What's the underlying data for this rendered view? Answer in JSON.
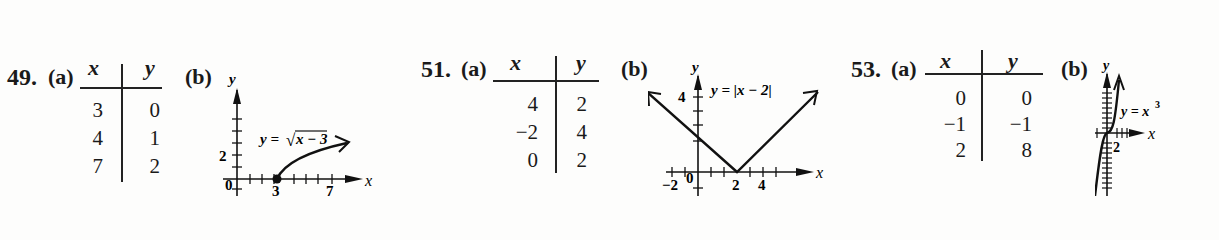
{
  "problems": [
    {
      "number": "49.",
      "part_a": "(a)",
      "part_b": "(b)",
      "table": {
        "headers": [
          "x",
          "y"
        ],
        "rows": [
          [
            "3",
            "0"
          ],
          [
            "4",
            "1"
          ],
          [
            "7",
            "2"
          ]
        ]
      },
      "graph": {
        "equation_prefix": "y = ",
        "equation_body": "x − 3",
        "axis_x": "x",
        "axis_y": "y",
        "tick_labels": {
          "origin": "0",
          "x1": "3",
          "x2": "7",
          "y1": "2"
        }
      }
    },
    {
      "number": "51.",
      "part_a": "(a)",
      "part_b": "(b)",
      "table": {
        "headers": [
          "x",
          "y"
        ],
        "rows": [
          [
            "4",
            "2"
          ],
          [
            "−2",
            "4"
          ],
          [
            "0",
            "2"
          ]
        ]
      },
      "graph": {
        "equation": "y = |x − 2|",
        "axis_x": "x",
        "axis_y": "y",
        "tick_labels": {
          "origin": "0",
          "xneg": "−2",
          "x1": "2",
          "x2": "4",
          "y1": "4"
        }
      }
    },
    {
      "number": "53.",
      "part_a": "(a)",
      "part_b": "(b)",
      "table": {
        "headers": [
          "x",
          "y"
        ],
        "rows": [
          [
            "0",
            "0"
          ],
          [
            "−1",
            "−1"
          ],
          [
            "2",
            "8"
          ]
        ]
      },
      "graph": {
        "equation_base": "y = x",
        "equation_exp": "3",
        "axis_x": "x",
        "axis_y": "y",
        "tick_labels": {
          "x1": "2",
          "y1": "8"
        }
      }
    }
  ]
}
